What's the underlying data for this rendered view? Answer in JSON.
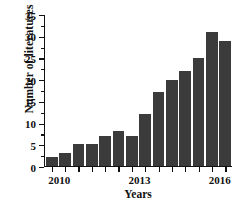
{
  "chart_data": {
    "type": "bar",
    "title": "",
    "xlabel": "Years",
    "ylabel": "Number of literatures",
    "categories": [
      "2010",
      "2011",
      "2012",
      "2013",
      "2014",
      "2015",
      "2016",
      "2017",
      "2018",
      "2019",
      "2020",
      "2021",
      "2022",
      "2023"
    ],
    "values": [
      2,
      3,
      5,
      5,
      7,
      8,
      7,
      12,
      17,
      20,
      22,
      25,
      31,
      29
    ],
    "ylim": [
      0,
      35
    ],
    "ytick_values": [
      0,
      5,
      10,
      15,
      20,
      25,
      30,
      35
    ],
    "ytick_labels": [
      "0",
      "5",
      "10",
      "15",
      "20",
      "25",
      "30",
      "35"
    ],
    "y_minor_ticks": [
      2.5,
      7.5,
      12.5,
      17.5,
      22.5,
      27.5,
      32.5
    ],
    "xtick_labels": [
      "2010",
      "2013",
      "2016",
      "2019",
      "2022"
    ],
    "xtick_categories": [
      "2010",
      "2013",
      "2016",
      "2019",
      "2022"
    ],
    "grid": false,
    "legend": null,
    "bar_color": "#3b3b3b",
    "axis_color": "#111111",
    "background_color": "#ffffff"
  }
}
